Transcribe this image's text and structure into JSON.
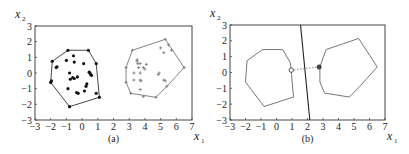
{
  "chart_data": [
    {
      "type": "scatter",
      "panel_label": "(a)",
      "xlabel": "x1",
      "ylabel": "x2",
      "xlim": [
        -3,
        7
      ],
      "ylim": [
        -3,
        3
      ],
      "xticks": [
        "-3",
        "-2",
        "-1",
        "0",
        "1",
        "2",
        "3",
        "4",
        "5",
        "6",
        "7"
      ],
      "yticks": [
        "3",
        "2",
        "1",
        "0",
        "-1",
        "-2",
        "-3"
      ],
      "grid": false,
      "series": [
        {
          "name": "class 1 (dots)",
          "marker": "filled-circle",
          "points": [
            [
              -0.9,
              1.45
            ],
            [
              0.4,
              1.45
            ],
            [
              -1.9,
              0.75
            ],
            [
              0.9,
              0.6
            ],
            [
              -2.0,
              -0.6
            ],
            [
              -1.95,
              -0.5
            ],
            [
              -0.8,
              -2.15
            ],
            [
              1.1,
              -1.55
            ],
            [
              -1.65,
              0.35
            ],
            [
              -1.6,
              0.4
            ],
            [
              -0.55,
              1.1
            ],
            [
              -1.0,
              0.8
            ],
            [
              -0.5,
              0.7
            ],
            [
              0.1,
              0.6
            ],
            [
              -0.8,
              0.0
            ],
            [
              -0.3,
              -0.25
            ],
            [
              -0.75,
              -0.4
            ],
            [
              -0.6,
              -0.3
            ],
            [
              -0.5,
              -0.35
            ],
            [
              0.5,
              0.0
            ],
            [
              0.55,
              -0.1
            ],
            [
              0.6,
              -0.15
            ],
            [
              0.45,
              0.05
            ],
            [
              0.3,
              -0.7
            ],
            [
              0.25,
              -0.85
            ],
            [
              -0.9,
              -1.0
            ],
            [
              0.15,
              -1.15
            ],
            [
              -0.35,
              -1.25
            ],
            [
              -0.25,
              -1.3
            ],
            [
              0.9,
              -1.3
            ]
          ],
          "hull": [
            [
              -0.9,
              1.45
            ],
            [
              0.4,
              1.45
            ],
            [
              0.9,
              0.6
            ],
            [
              1.1,
              -1.55
            ],
            [
              -0.8,
              -2.15
            ],
            [
              -2.0,
              -0.6
            ],
            [
              -1.9,
              0.75
            ]
          ]
        },
        {
          "name": "class 2 (crosses)",
          "marker": "plus",
          "points": [
            [
              3.2,
              1.45
            ],
            [
              5.3,
              2.15
            ],
            [
              5.7,
              1.45
            ],
            [
              6.5,
              0.35
            ],
            [
              5.4,
              -0.85
            ],
            [
              4.7,
              -1.55
            ],
            [
              3.9,
              -1.5
            ],
            [
              3.1,
              -1.3
            ],
            [
              2.8,
              -0.6
            ],
            [
              2.8,
              0.35
            ],
            [
              5.0,
              1.6
            ],
            [
              5.2,
              1.3
            ],
            [
              5.5,
              1.8
            ],
            [
              3.5,
              0.85
            ],
            [
              3.5,
              0.75
            ],
            [
              3.55,
              0.6
            ],
            [
              3.7,
              0.6
            ],
            [
              4.1,
              0.55
            ],
            [
              3.9,
              0.35
            ],
            [
              4.0,
              0.25
            ],
            [
              3.6,
              0.35
            ],
            [
              3.3,
              0.0
            ],
            [
              3.7,
              0.0
            ],
            [
              3.3,
              -0.45
            ],
            [
              3.7,
              -0.45
            ],
            [
              3.75,
              -0.5
            ],
            [
              4.9,
              0.0
            ],
            [
              4.85,
              -0.1
            ],
            [
              5.2,
              -0.45
            ],
            [
              5.3,
              -0.5
            ],
            [
              3.7,
              -1.05
            ]
          ],
          "hull": [
            [
              3.2,
              1.45
            ],
            [
              5.3,
              2.15
            ],
            [
              6.5,
              0.35
            ],
            [
              5.4,
              -0.85
            ],
            [
              4.7,
              -1.55
            ],
            [
              3.1,
              -1.3
            ],
            [
              2.8,
              -0.6
            ],
            [
              2.8,
              0.35
            ]
          ]
        }
      ]
    },
    {
      "type": "line",
      "panel_label": "(b)",
      "xlabel": "x1",
      "ylabel": "x2",
      "xlim": [
        -3,
        7
      ],
      "ylim": [
        -3,
        3
      ],
      "xticks": [
        "-3",
        "-2",
        "-1",
        "0",
        "1",
        "2",
        "3",
        "4",
        "5",
        "6",
        "7"
      ],
      "yticks": [
        "3",
        "2",
        "1",
        "0",
        "-1",
        "-2",
        "-3"
      ],
      "grid": false,
      "series": [
        {
          "name": "hull class 1",
          "points": [
            [
              -0.9,
              1.45
            ],
            [
              0.4,
              1.45
            ],
            [
              0.9,
              0.6
            ],
            [
              1.1,
              -1.55
            ],
            [
              -0.8,
              -2.15
            ],
            [
              -2.0,
              -0.6
            ],
            [
              -1.9,
              0.75
            ],
            [
              -0.9,
              1.45
            ]
          ]
        },
        {
          "name": "hull class 2",
          "points": [
            [
              3.2,
              1.45
            ],
            [
              5.3,
              2.15
            ],
            [
              6.5,
              0.35
            ],
            [
              5.4,
              -0.85
            ],
            [
              4.7,
              -1.55
            ],
            [
              3.1,
              -1.3
            ],
            [
              2.8,
              -0.6
            ],
            [
              2.8,
              0.35
            ],
            [
              3.2,
              1.45
            ]
          ]
        },
        {
          "name": "separating line",
          "points": [
            [
              1.55,
              3.0
            ],
            [
              2.15,
              -3.0
            ]
          ]
        },
        {
          "name": "closest-point segment",
          "style": "dotted",
          "points": [
            [
              0.95,
              0.15
            ],
            [
              2.75,
              0.35
            ]
          ]
        }
      ],
      "annotations": [
        {
          "type": "open-circle",
          "at": [
            0.95,
            0.15
          ]
        },
        {
          "type": "filled-circle",
          "at": [
            2.75,
            0.35
          ]
        }
      ]
    }
  ],
  "labels": {
    "panel_a": "(a)",
    "panel_b": "(b)",
    "x_var": "x",
    "x_sub": "1",
    "y_var": "x",
    "y_sub": "2"
  }
}
